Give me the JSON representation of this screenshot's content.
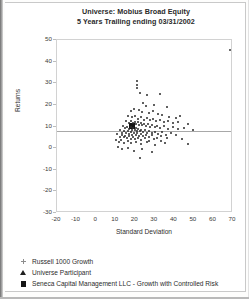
{
  "chart_data": {
    "type": "scatter",
    "title": "Universe: Mobius Broad Equity",
    "subtitle": "5 Years Trailing ending 03/31/2002",
    "xlabel": "Standard Deviation",
    "ylabel": "Returns",
    "xlim": [
      -20,
      70
    ],
    "ylim": [
      -30,
      50
    ],
    "xticks": [
      -20,
      -10,
      0,
      10,
      20,
      30,
      40,
      50,
      60,
      70
    ],
    "yticks": [
      -30,
      -20,
      -10,
      0,
      10,
      20,
      30,
      40,
      50
    ],
    "grid": false,
    "legend_position": "below-plot",
    "reference_line": {
      "orientation": "horizontal",
      "y": 8.0
    },
    "series": [
      {
        "name": "Russell 1000 Growth",
        "marker": "cross",
        "points": [
          {
            "x": 68.5,
            "y": 45.5
          }
        ]
      },
      {
        "name": "Seneca Capital Management LLC - Growth with Controlled Risk",
        "marker": "square",
        "points": [
          {
            "x": 18.6,
            "y": 10.4
          }
        ]
      },
      {
        "name": "Universe Participant",
        "marker": "triangle",
        "points": [
          {
            "x": 20.9,
            "y": 31.2
          },
          {
            "x": 20.9,
            "y": 29.4
          },
          {
            "x": 20.9,
            "y": 27.8
          },
          {
            "x": 22.6,
            "y": 25.6
          },
          {
            "x": 26.1,
            "y": 24.4
          },
          {
            "x": 32.8,
            "y": 24.9
          },
          {
            "x": 29.4,
            "y": 19.9
          },
          {
            "x": 36.0,
            "y": 19.1
          },
          {
            "x": 24.0,
            "y": 20.7
          },
          {
            "x": 25.4,
            "y": 19.4
          },
          {
            "x": 19.4,
            "y": 18.3
          },
          {
            "x": 17.6,
            "y": 17.0
          },
          {
            "x": 21.8,
            "y": 17.4
          },
          {
            "x": 23.5,
            "y": 16.6
          },
          {
            "x": 26.8,
            "y": 16.2
          },
          {
            "x": 28.9,
            "y": 17.2
          },
          {
            "x": 31.5,
            "y": 16.0
          },
          {
            "x": 33.9,
            "y": 15.1
          },
          {
            "x": 37.2,
            "y": 14.6
          },
          {
            "x": 40.6,
            "y": 13.8
          },
          {
            "x": 43.1,
            "y": 14.9
          },
          {
            "x": 16.4,
            "y": 15.0
          },
          {
            "x": 18.2,
            "y": 14.3
          },
          {
            "x": 20.1,
            "y": 14.9
          },
          {
            "x": 21.5,
            "y": 13.6
          },
          {
            "x": 22.8,
            "y": 14.4
          },
          {
            "x": 24.3,
            "y": 13.2
          },
          {
            "x": 25.9,
            "y": 13.9
          },
          {
            "x": 27.4,
            "y": 12.8
          },
          {
            "x": 29.1,
            "y": 13.5
          },
          {
            "x": 30.8,
            "y": 12.4
          },
          {
            "x": 32.6,
            "y": 13.1
          },
          {
            "x": 34.5,
            "y": 12.0
          },
          {
            "x": 36.8,
            "y": 12.7
          },
          {
            "x": 39.2,
            "y": 11.6
          },
          {
            "x": 41.7,
            "y": 12.3
          },
          {
            "x": 15.1,
            "y": 12.6
          },
          {
            "x": 16.8,
            "y": 11.8
          },
          {
            "x": 17.9,
            "y": 12.5
          },
          {
            "x": 19.0,
            "y": 11.4
          },
          {
            "x": 19.8,
            "y": 12.2
          },
          {
            "x": 20.6,
            "y": 11.0
          },
          {
            "x": 21.3,
            "y": 11.9
          },
          {
            "x": 22.1,
            "y": 10.8
          },
          {
            "x": 22.9,
            "y": 11.6
          },
          {
            "x": 23.7,
            "y": 10.5
          },
          {
            "x": 24.6,
            "y": 11.3
          },
          {
            "x": 25.5,
            "y": 10.2
          },
          {
            "x": 26.4,
            "y": 11.0
          },
          {
            "x": 27.5,
            "y": 10.0
          },
          {
            "x": 28.6,
            "y": 10.7
          },
          {
            "x": 29.9,
            "y": 9.6
          },
          {
            "x": 31.2,
            "y": 10.4
          },
          {
            "x": 32.9,
            "y": 9.3
          },
          {
            "x": 34.8,
            "y": 10.1
          },
          {
            "x": 36.9,
            "y": 9.0
          },
          {
            "x": 39.4,
            "y": 9.8
          },
          {
            "x": 42.0,
            "y": 8.7
          },
          {
            "x": 44.8,
            "y": 9.5
          },
          {
            "x": 13.6,
            "y": 10.3
          },
          {
            "x": 14.8,
            "y": 9.2
          },
          {
            "x": 15.9,
            "y": 10.0
          },
          {
            "x": 16.9,
            "y": 8.9
          },
          {
            "x": 17.7,
            "y": 9.7
          },
          {
            "x": 18.4,
            "y": 8.6
          },
          {
            "x": 19.1,
            "y": 9.4
          },
          {
            "x": 19.7,
            "y": 8.3
          },
          {
            "x": 20.3,
            "y": 9.1
          },
          {
            "x": 20.9,
            "y": 8.0
          },
          {
            "x": 21.6,
            "y": 8.8
          },
          {
            "x": 22.3,
            "y": 7.7
          },
          {
            "x": 23.1,
            "y": 8.5
          },
          {
            "x": 24.0,
            "y": 7.4
          },
          {
            "x": 25.0,
            "y": 8.2
          },
          {
            "x": 26.1,
            "y": 7.1
          },
          {
            "x": 27.3,
            "y": 7.9
          },
          {
            "x": 28.7,
            "y": 6.8
          },
          {
            "x": 30.2,
            "y": 7.6
          },
          {
            "x": 31.9,
            "y": 6.5
          },
          {
            "x": 33.8,
            "y": 7.3
          },
          {
            "x": 35.9,
            "y": 6.2
          },
          {
            "x": 38.3,
            "y": 7.0
          },
          {
            "x": 41.0,
            "y": 5.9
          },
          {
            "x": 12.1,
            "y": 8.4
          },
          {
            "x": 13.2,
            "y": 7.2
          },
          {
            "x": 14.3,
            "y": 8.0
          },
          {
            "x": 15.3,
            "y": 6.9
          },
          {
            "x": 16.2,
            "y": 7.7
          },
          {
            "x": 17.0,
            "y": 6.6
          },
          {
            "x": 17.8,
            "y": 7.4
          },
          {
            "x": 18.6,
            "y": 6.3
          },
          {
            "x": 19.4,
            "y": 7.1
          },
          {
            "x": 20.2,
            "y": 6.0
          },
          {
            "x": 21.1,
            "y": 6.8
          },
          {
            "x": 22.0,
            "y": 5.7
          },
          {
            "x": 23.0,
            "y": 6.5
          },
          {
            "x": 24.2,
            "y": 5.4
          },
          {
            "x": 25.5,
            "y": 6.2
          },
          {
            "x": 27.0,
            "y": 5.1
          },
          {
            "x": 28.8,
            "y": 5.9
          },
          {
            "x": 30.9,
            "y": 4.8
          },
          {
            "x": 33.3,
            "y": 5.6
          },
          {
            "x": 36.2,
            "y": 4.5
          },
          {
            "x": 10.8,
            "y": 6.4
          },
          {
            "x": 12.0,
            "y": 5.3
          },
          {
            "x": 13.1,
            "y": 6.1
          },
          {
            "x": 14.1,
            "y": 5.0
          },
          {
            "x": 15.0,
            "y": 5.8
          },
          {
            "x": 15.9,
            "y": 4.7
          },
          {
            "x": 16.8,
            "y": 5.5
          },
          {
            "x": 17.8,
            "y": 4.4
          },
          {
            "x": 18.9,
            "y": 5.2
          },
          {
            "x": 20.1,
            "y": 4.1
          },
          {
            "x": 21.5,
            "y": 4.9
          },
          {
            "x": 23.1,
            "y": 3.8
          },
          {
            "x": 25.0,
            "y": 4.6
          },
          {
            "x": 27.2,
            "y": 3.5
          },
          {
            "x": 29.8,
            "y": 4.3
          },
          {
            "x": 33.0,
            "y": 3.2
          },
          {
            "x": 10.2,
            "y": 3.9
          },
          {
            "x": 11.5,
            "y": 2.8
          },
          {
            "x": 12.9,
            "y": 3.6
          },
          {
            "x": 14.4,
            "y": 2.5
          },
          {
            "x": 16.1,
            "y": 3.3
          },
          {
            "x": 18.0,
            "y": 2.2
          },
          {
            "x": 20.2,
            "y": 3.0
          },
          {
            "x": 22.8,
            "y": 1.9
          },
          {
            "x": 26.0,
            "y": 2.7
          },
          {
            "x": 30.1,
            "y": 1.6
          },
          {
            "x": 35.0,
            "y": 2.4
          },
          {
            "x": 11.2,
            "y": 0.6
          },
          {
            "x": 13.4,
            "y": -0.4
          },
          {
            "x": 16.2,
            "y": 0.2
          },
          {
            "x": 19.6,
            "y": -1.2
          },
          {
            "x": 23.6,
            "y": -0.6
          },
          {
            "x": 28.4,
            "y": -1.8
          },
          {
            "x": 22.4,
            "y": -4.6
          },
          {
            "x": 46.8,
            "y": 11.2
          },
          {
            "x": 49.5,
            "y": 8.4
          },
          {
            "x": 44.0,
            "y": 4.2
          },
          {
            "x": 47.2,
            "y": 2.0
          }
        ]
      }
    ]
  },
  "legend": {
    "items": [
      {
        "marker": "cross",
        "label": "Russell 1000 Growth"
      },
      {
        "marker": "triangle",
        "label": "Universe Participant"
      },
      {
        "marker": "square",
        "label": "Seneca Capital Management LLC - Growth with Controlled Risk"
      }
    ]
  }
}
